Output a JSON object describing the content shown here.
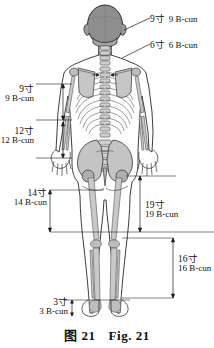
{
  "figure": {
    "title_cn": "图 21",
    "title_en": "Fig. 21",
    "view": "posterior view of human body with skeleton overlay",
    "unit_cn": "寸",
    "unit_en": "B-cun"
  },
  "caption": {
    "cn": "图 21",
    "en": "Fig. 21"
  },
  "measurements": [
    {
      "id": "head-9",
      "cn": "9寸",
      "en": "9 B-cun",
      "side": "right",
      "kind": "leader",
      "target": "head width / vertex region"
    },
    {
      "id": "neck-6",
      "cn": "6寸",
      "en": "6 B-cun",
      "side": "right",
      "kind": "leader",
      "target": "posterior hairline to C7, neck region"
    },
    {
      "id": "upper-arm-9",
      "cn": "9寸",
      "en": "9 B-cun",
      "side": "left",
      "kind": "dimension",
      "target": "axillary fold to cubital crease"
    },
    {
      "id": "forearm-12",
      "cn": "12寸",
      "en": "12 B-cun",
      "side": "left",
      "kind": "dimension",
      "target": "cubital crease to wrist crease"
    },
    {
      "id": "hip-knee-14",
      "cn": "14寸",
      "en": "14 B-cun",
      "side": "left",
      "kind": "dimension",
      "target": "gluteal fold to popliteal crease"
    },
    {
      "id": "greater-troch-19",
      "cn": "19寸",
      "en": "19 B-cun",
      "side": "right",
      "kind": "dimension",
      "target": "greater trochanter to popliteal crease"
    },
    {
      "id": "knee-ankle-16",
      "cn": "16寸",
      "en": "16 B-cun",
      "side": "right",
      "kind": "dimension",
      "target": "popliteal crease to lateral malleolus"
    },
    {
      "id": "ankle-heel-3",
      "cn": "3寸",
      "en": "3 B-cun",
      "side": "left",
      "kind": "dimension",
      "target": "malleolus to heel / sole"
    }
  ],
  "colors": {
    "line": "#1a1a1a",
    "skeleton_fill": "#b9b9b9",
    "skeleton_fill_light": "#d2d2d2",
    "skull_fill": "#8e8e8e",
    "body_fill": "#ffffff",
    "background": "#ffffff"
  }
}
